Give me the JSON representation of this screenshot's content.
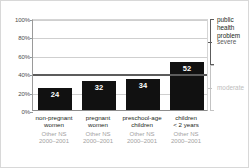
{
  "chart_data": {
    "type": "bar",
    "title": "",
    "subtitle": "",
    "xlabel": "",
    "ylabel": "",
    "ylim": [
      0,
      100
    ],
    "y_unit": "%",
    "grid": true,
    "legend_position": "right",
    "categories": [
      "non-pregnant\nwomen",
      "pregnant\nwomen",
      "preschool-age\nchildren",
      "children\n< 2 years"
    ],
    "values": [
      24,
      32,
      34,
      52
    ],
    "value_labels": [
      "24",
      "32",
      "34",
      "52"
    ],
    "category_sources": [
      "Other NS",
      "Other NS",
      "Other NS",
      "Other NS"
    ],
    "category_years": [
      "2000–2001",
      "2000–2001",
      "2000–2001",
      "2000–2001"
    ],
    "y_ticks": [
      "0%",
      "20%",
      "40%",
      "60%",
      "80%",
      "100%"
    ],
    "y_tick_values": [
      0,
      20,
      40,
      60,
      80,
      100
    ],
    "threshold_lines": [
      {
        "label": "severe",
        "value": 40
      },
      {
        "label": "moderate",
        "value": 20
      }
    ],
    "annotations": {
      "bracket_title": "public\nhealth\nproblem",
      "severity_severe": "severe",
      "severity_moderate": "moderate"
    },
    "colors": {
      "bar": "#111111",
      "value_label": "#ffffff",
      "gridline": "#cfcfcf",
      "threshold": "#5c5c5c",
      "axis": "#9a9a9a",
      "source_text": "#a2a2a2",
      "moderate_text": "#bdbdbd",
      "background": "#ffffff"
    }
  },
  "legend": {
    "bracket_title": "public\nhealth\nproblem",
    "severe_label": "severe",
    "moderate_label": "moderate"
  }
}
